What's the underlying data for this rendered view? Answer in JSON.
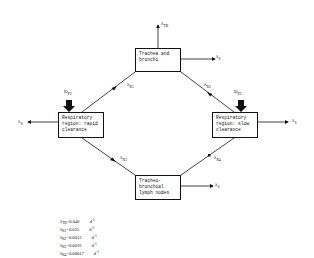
{
  "boxes": {
    "trachea": {
      "line1": "Trachea and",
      "line2": "bronchi"
    },
    "rapid": {
      "line1": "Respiratory",
      "line2": "region: rapid",
      "line3": "clearance"
    },
    "slow": {
      "line1": "Respiratory",
      "line2": "region: slow",
      "line3": "clearance"
    },
    "lymph": {
      "line1": "Tracheo-",
      "line2": "bronchial",
      "line3": "lymph nodes"
    }
  },
  "labels": {
    "lambda": "λ",
    "tb_sub": "TB",
    "s_sub": "S",
    "r1_sub": "R1",
    "r2_sub": "R2",
    "r3_sub": "R3",
    "r4_sub": "R4",
    "d": "D",
    "p2_sub": "P2"
  },
  "legend": [
    {
      "sym": "λ",
      "sub": "TB",
      "value": "=0.046",
      "unit": "d",
      "exp": "-1"
    },
    {
      "sym": "λ",
      "sub": "R1",
      "value": "=0.025",
      "unit": "d",
      "exp": "-1"
    },
    {
      "sym": "λ",
      "sub": "R2",
      "value": "=0.0012",
      "unit": "d",
      "exp": "-1"
    },
    {
      "sym": "λ",
      "sub": "R3",
      "value": "=0.0016",
      "unit": "d",
      "exp": "-1"
    },
    {
      "sym": "λ",
      "sub": "R4",
      "value": "=0.00017",
      "unit": "d",
      "exp": "-1"
    }
  ]
}
